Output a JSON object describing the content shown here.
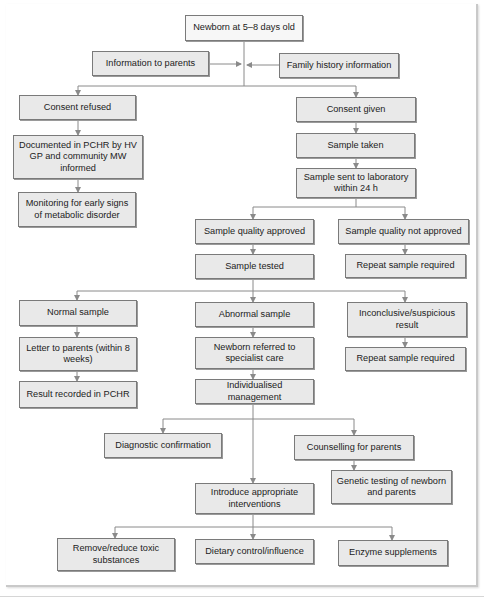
{
  "colors": {
    "box_fill": "#e9e9e9",
    "box_border": "#7a7a7a",
    "connector": "#8a8a8a"
  },
  "nodes": {
    "newborn": "Newborn at 5–8 days old",
    "info_parents": "Information to parents",
    "family_history": "Family history information",
    "consent_refused": "Consent refused",
    "documented": "Documented in PCHR by HV GP and community MW informed",
    "monitoring": "Monitoring for early signs of metabolic disorder",
    "consent_given": "Consent given",
    "sample_taken": "Sample taken",
    "sample_sent": "Sample sent to laboratory within 24 h",
    "quality_approved": "Sample quality approved",
    "quality_not_approved": "Sample quality not approved",
    "repeat_sample_1": "Repeat sample required",
    "sample_tested": "Sample tested",
    "normal_sample": "Normal sample",
    "abnormal_sample": "Abnormal sample",
    "inconclusive": "Inconclusive/suspicious result",
    "letter_parents": "Letter to parents (within 8 weeks)",
    "referred": "Newborn referred to specialist care",
    "repeat_sample_2": "Repeat sample required",
    "result_recorded": "Result recorded in PCHR",
    "individualised": "Individualised management",
    "diagnostic": "Diagnostic confirmation",
    "counselling": "Counselling for parents",
    "genetic_testing": "Genetic testing of newborn and parents",
    "interventions": "Introduce appropriate interventions",
    "remove_toxic": "Remove/reduce toxic substances",
    "dietary": "Dietary control/influence",
    "enzyme": "Enzyme supplements"
  }
}
